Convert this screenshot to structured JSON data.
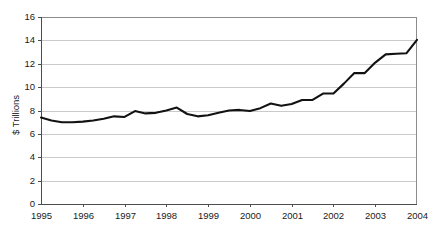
{
  "chart_data": {
    "type": "line",
    "title": "",
    "subtitle": "",
    "xlabel": "",
    "ylabel": "$ Trillions",
    "xlim": [
      1995,
      2004
    ],
    "ylim": [
      0,
      16
    ],
    "grid": true,
    "legend": false,
    "legend_position": "none",
    "y_ticks": [
      0,
      2,
      4,
      6,
      8,
      10,
      12,
      14,
      16
    ],
    "y_tick_labels": [
      "0",
      "2",
      "4",
      "6",
      "8",
      "10",
      "12",
      "14",
      "16"
    ],
    "x_ticks": [
      1995,
      1996,
      1997,
      1998,
      1999,
      2000,
      2001,
      2002,
      2003,
      2004
    ],
    "x_tick_labels": [
      "1995",
      "1996",
      "1997",
      "1998",
      "1999",
      "2000",
      "2001",
      "2002",
      "2003",
      "2004"
    ],
    "series": [
      {
        "name": "$ Trillions",
        "color": "#121212",
        "x": [
          1995.0,
          1995.25,
          1995.5,
          1995.75,
          1996.0,
          1996.25,
          1996.5,
          1996.75,
          1997.0,
          1997.25,
          1997.5,
          1997.75,
          1998.0,
          1998.25,
          1998.5,
          1998.75,
          1999.0,
          1999.25,
          1999.5,
          1999.75,
          2000.0,
          2000.25,
          2000.5,
          2000.75,
          2001.0,
          2001.25,
          2001.5,
          2001.75,
          2002.0,
          2002.25,
          2002.5,
          2002.75,
          2003.0,
          2003.25,
          2003.5,
          2003.75,
          2004.0
        ],
        "values": [
          7.4,
          7.15,
          7.0,
          7.0,
          7.05,
          7.15,
          7.3,
          7.5,
          7.45,
          7.95,
          7.75,
          7.8,
          8.0,
          8.25,
          7.7,
          7.5,
          7.6,
          7.8,
          8.0,
          8.05,
          7.95,
          8.2,
          8.6,
          8.4,
          8.55,
          8.9,
          8.9,
          9.45,
          9.45,
          10.3,
          11.2,
          11.2,
          12.1,
          12.8,
          12.85,
          12.9,
          14.05
        ]
      }
    ]
  },
  "axis": {
    "y_title": "$ Trillions"
  }
}
